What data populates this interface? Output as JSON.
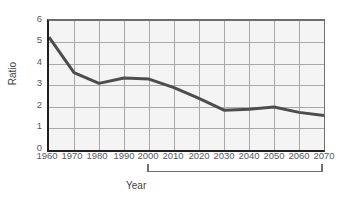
{
  "chart_data": {
    "type": "line",
    "title": "",
    "xlabel": "Year",
    "ylabel": "Ratio",
    "xlim": [
      1960,
      2070
    ],
    "ylim": [
      0,
      6
    ],
    "ytick_step": 1,
    "xtick_step": 10,
    "grid": true,
    "legend": null,
    "line_color": "#4d4d4d",
    "plot_background": "#f4f4f4",
    "grid_color": "#a7a9ac",
    "x": [
      1960,
      1970,
      1980,
      1990,
      2000,
      2010,
      2020,
      2030,
      2040,
      2050,
      2060,
      2070
    ],
    "values": [
      5.25,
      3.6,
      3.1,
      3.35,
      3.3,
      2.9,
      2.4,
      1.85,
      1.9,
      2.0,
      1.75,
      1.6
    ],
    "series": [
      {
        "name": "Ratio",
        "values": [
          5.25,
          3.6,
          3.1,
          3.35,
          3.3,
          2.9,
          2.4,
          1.85,
          1.9,
          2.0,
          1.75,
          1.6
        ]
      }
    ],
    "ytick_labels": [
      "6",
      "5",
      "4",
      "3",
      "2",
      "1",
      "0"
    ],
    "ytick_values": [
      6,
      5,
      4,
      3,
      2,
      1,
      0
    ],
    "xtick_labels": [
      "1960",
      "1970",
      "1980",
      "1990",
      "2000",
      "2010",
      "2020",
      "2030",
      "2040",
      "2050",
      "2060",
      "2070"
    ],
    "xtick_values": [
      1960,
      1970,
      1980,
      1990,
      2000,
      2010,
      2020,
      2030,
      2040,
      2050,
      2060,
      2070
    ],
    "annotations": [
      {
        "label": "Projected",
        "type": "range-bracket",
        "from": 2000,
        "to": 2070
      }
    ]
  },
  "axes": {
    "y_title": "Ratio",
    "x_title": "Year"
  },
  "annotation": {
    "projected_label": "Projected"
  }
}
